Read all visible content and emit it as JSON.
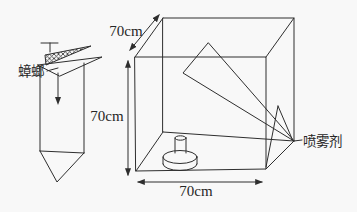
{
  "diagram": {
    "type": "geometry-problem-figure",
    "background": "#f8f8f8",
    "ink_color": "#2e2e2e",
    "prism_figure": {
      "cockroach_label": "蟑螂",
      "marker": "flag-on-pole",
      "shape": "vertical triangular prism with hatched triangular top board and downward arrow"
    },
    "box_figure": {
      "shape": "cube wireframe with large internal triangle, small corner triangle and spray can on floor",
      "spray_label": "喷雾剂",
      "dimensions": {
        "depth_label": "70cm",
        "height_label": "70cm",
        "width_label": "70cm"
      }
    }
  }
}
